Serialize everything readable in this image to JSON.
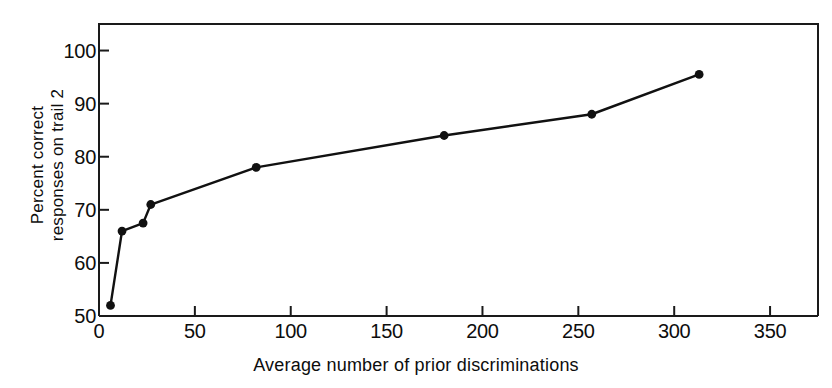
{
  "chart_data": {
    "type": "line",
    "title": "",
    "xlabel": "Average number of prior discriminations",
    "ylabel": "Percent correct responses on trail 2",
    "ylabel_line1": "Percent correct",
    "ylabel_line2": "responses on trail 2",
    "xlim": [
      0,
      375
    ],
    "ylim": [
      50,
      105
    ],
    "xticks": [
      0,
      50,
      100,
      150,
      200,
      250,
      300,
      350
    ],
    "yticks": [
      50,
      60,
      70,
      80,
      90,
      100
    ],
    "xtick_labels": [
      "0",
      "50",
      "100",
      "150",
      "200",
      "250",
      "300",
      "350"
    ],
    "ytick_labels": [
      "50",
      "60",
      "70",
      "80",
      "90",
      "100"
    ],
    "grid": false,
    "legend": "none",
    "marker": "filled-circle",
    "line_color": "#111111",
    "marker_color": "#111111",
    "axis_color": "#1a1a1a",
    "background": "#ffffff",
    "x": [
      6,
      12,
      23,
      27,
      82,
      180,
      257,
      313
    ],
    "values": [
      52,
      66,
      67.5,
      71,
      78,
      84,
      88,
      95.5
    ],
    "series": [
      {
        "name": "Percent correct responses on trail 2",
        "points": [
          {
            "x": 6,
            "y": 52
          },
          {
            "x": 12,
            "y": 66
          },
          {
            "x": 23,
            "y": 67.5
          },
          {
            "x": 27,
            "y": 71
          },
          {
            "x": 82,
            "y": 78
          },
          {
            "x": 180,
            "y": 84
          },
          {
            "x": 257,
            "y": 88
          },
          {
            "x": 313,
            "y": 95.5
          }
        ]
      }
    ]
  }
}
